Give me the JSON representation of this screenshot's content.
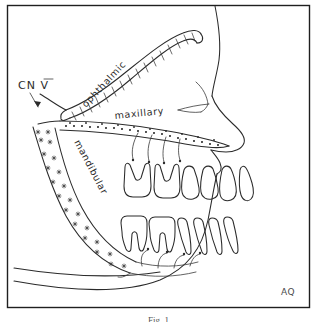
{
  "figure": {
    "kind": "hand-drawn anatomical line diagram",
    "background_color": "#ffffff",
    "ink_color": "#2b2b2b",
    "frame": {
      "present": true,
      "color": "#1f1f1f"
    },
    "caption": "Fig. 1",
    "signature": "AQ"
  },
  "labels": {
    "nerve_root": "CN V",
    "division_1": "ophthalmic",
    "division_2": "maxillary",
    "division_3": "mandibular"
  },
  "divisions": [
    {
      "name": "ophthalmic",
      "label": "ophthalmic",
      "texture": "diagonal-hatching",
      "label_rotation_deg": -47,
      "description": "superior branch sweeping up and forward over the orbit"
    },
    {
      "name": "maxillary",
      "label": "maxillary",
      "texture": "dotted-stipple",
      "label_rotation_deg": -6,
      "description": "middle branch running forward above the upper teeth"
    },
    {
      "name": "mandibular",
      "label": "mandibular",
      "texture": "star-stipple",
      "label_rotation_deg": 62,
      "description": "inferior branch descending along the ramus into the lower jaw"
    }
  ],
  "teeth": {
    "upper_count": 6,
    "lower_count": 6,
    "upper_orientation": "roots up, crowns down",
    "lower_orientation": "crowns up, roots down"
  },
  "annotations": {
    "pointer_from": "CN V",
    "pointer_to": "trigeminal nerve trunk"
  }
}
